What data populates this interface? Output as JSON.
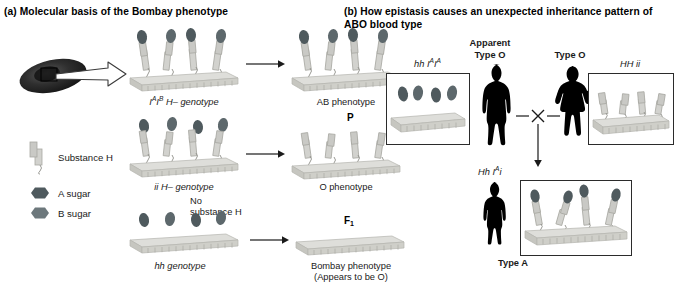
{
  "figure": {
    "panels": [
      {
        "tag": "(a)",
        "title": "Molecular basis of the Bombay phenotype"
      },
      {
        "tag": "(b)",
        "title": "How epistasis causes an unexpected inheritance pattern of ABO blood type"
      }
    ]
  },
  "legend": {
    "items": [
      {
        "label": "Substance H",
        "icon": "substance-h-icon"
      },
      {
        "label": "A sugar",
        "icon": "a-sugar-icon"
      },
      {
        "label": "B sugar",
        "icon": "b-sugar-icon"
      }
    ]
  },
  "panel_a": {
    "rows": [
      {
        "genotype_plain": "",
        "genotype_html": "I^A I^B H- genotype",
        "genotype_parts": {
          "i1": "I",
          "sup1": "A",
          "i2": "I",
          "sup2": "B",
          "rest": " H– genotype"
        },
        "result": "AB phenotype",
        "note": ""
      },
      {
        "genotype_parts": {
          "i1": "ii",
          "sup1": "",
          "i2": "",
          "sup2": "",
          "rest": " H– genotype"
        },
        "result": "O phenotype",
        "note": ""
      },
      {
        "genotype_parts": {
          "i1": "hh",
          "sup1": "",
          "i2": "",
          "sup2": "",
          "rest": " genotype"
        },
        "result": "Bombay phenotype",
        "result_sub": "(Appears to be O)",
        "note_line1": "No",
        "note_line2": "substance H"
      }
    ],
    "cell_label": "red-blood-cell"
  },
  "panel_b": {
    "generation_labels": {
      "parent": "P",
      "f1": "F",
      "f1_sub": "1"
    },
    "parents": [
      {
        "phenotype_line1": "Apparent",
        "phenotype_line2": "Type O",
        "genotype": {
          "plain": "hh ",
          "allele1": "I",
          "sup1": "A",
          "allele2": "I",
          "sup2": "A"
        },
        "figure": "male-silhouette"
      },
      {
        "phenotype_line1": "",
        "phenotype_line2": "Type O",
        "genotype": {
          "plain": "HH ii",
          "allele1": "",
          "sup1": "",
          "allele2": "",
          "sup2": ""
        },
        "figure": "female-silhouette"
      }
    ],
    "cross_symbol": "×",
    "offspring": {
      "genotype": {
        "plain": "Hh ",
        "allele1": "I",
        "sup1": "A",
        "allele2": "i",
        "sup2": ""
      },
      "phenotype": "Type A",
      "figure": "child-silhouette"
    }
  },
  "colors": {
    "membrane_top": "#d8d8d4",
    "membrane_side": "#c3c3bd",
    "substance_h": "#cfcfcb",
    "sugar_dark": "#4f5a5e",
    "sugar_mid": "#707c80",
    "rbc": "#2a2a2a",
    "silhouette": "#000000",
    "frame": "#2b2b2b",
    "text": "#1a1a1a"
  }
}
